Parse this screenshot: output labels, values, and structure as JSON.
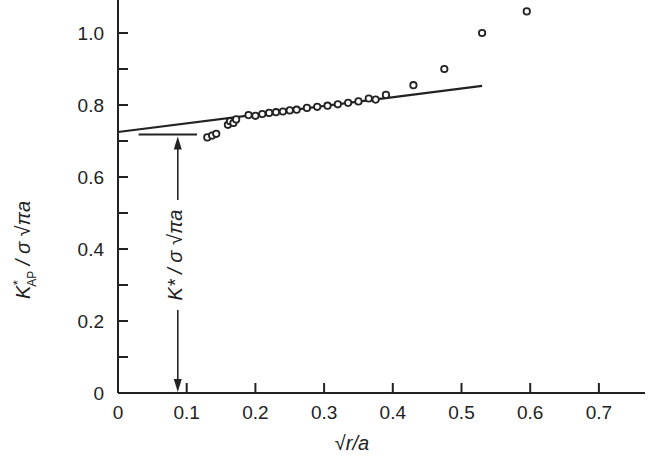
{
  "chart_data": {
    "type": "scatter",
    "title": "",
    "xlabel": "√(r/a)",
    "ylabel": "K*_AP / σ √(πa)",
    "xlim": [
      0,
      0.77
    ],
    "ylim": [
      0,
      1.1
    ],
    "grid": false,
    "x_ticks": [
      "0",
      "0.1",
      "0.2",
      "0.3",
      "0.4",
      "0.5",
      "0.6",
      "0.7"
    ],
    "y_ticks": [
      "0",
      "0.2",
      "0.4",
      "0.6",
      "0.8",
      "1.0"
    ],
    "series": [
      {
        "name": "measured K*_AP",
        "marker": "open-circle",
        "points": [
          [
            0.13,
            0.71
          ],
          [
            0.137,
            0.715
          ],
          [
            0.143,
            0.72
          ],
          [
            0.16,
            0.745
          ],
          [
            0.163,
            0.755
          ],
          [
            0.168,
            0.75
          ],
          [
            0.172,
            0.76
          ],
          [
            0.19,
            0.772
          ],
          [
            0.2,
            0.77
          ],
          [
            0.21,
            0.775
          ],
          [
            0.22,
            0.778
          ],
          [
            0.23,
            0.78
          ],
          [
            0.24,
            0.782
          ],
          [
            0.25,
            0.785
          ],
          [
            0.26,
            0.787
          ],
          [
            0.275,
            0.792
          ],
          [
            0.29,
            0.795
          ],
          [
            0.305,
            0.798
          ],
          [
            0.32,
            0.802
          ],
          [
            0.335,
            0.806
          ],
          [
            0.35,
            0.81
          ],
          [
            0.365,
            0.818
          ],
          [
            0.375,
            0.815
          ],
          [
            0.39,
            0.828
          ],
          [
            0.43,
            0.855
          ],
          [
            0.475,
            0.9
          ],
          [
            0.53,
            1.0
          ],
          [
            0.595,
            1.06
          ]
        ]
      },
      {
        "name": "linear fit",
        "type": "line",
        "points": [
          [
            0.0,
            0.725
          ],
          [
            0.53,
            0.853
          ]
        ]
      }
    ],
    "annotations": [
      {
        "type": "horizontal-line",
        "label": "intercept marker",
        "y": 0.718,
        "x_range": [
          0.03,
          0.115
        ]
      },
      {
        "type": "double-arrow",
        "x": 0.087,
        "y_range": [
          0,
          0.718
        ],
        "text": "K* / σ √(πa)"
      }
    ]
  },
  "labels": {
    "x_axis_title": "√r/a",
    "y_axis_title_main": "K",
    "y_axis_title_sup": "*",
    "y_axis_title_sub": "AP",
    "y_axis_title_rest": " / σ √πa",
    "arrow_label": "K* / σ √πa"
  }
}
